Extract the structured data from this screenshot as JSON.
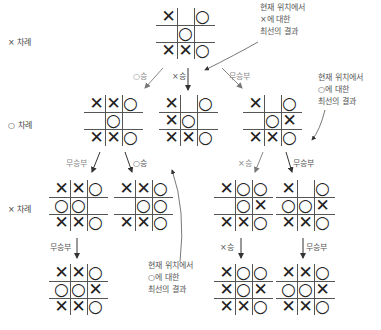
{
  "turn_labels": {
    "row0": "× 차례",
    "row1": "○ 차례",
    "row2": "× 차례"
  },
  "notes": {
    "top": [
      "현재 위치에서",
      "×에 대한",
      "최선의 결과"
    ],
    "right": [
      "현재 위치에서",
      "○에 대한",
      "최선의 결과"
    ],
    "bottom": [
      "현재 위치에서",
      "○에 대한",
      "최선의 결과"
    ]
  },
  "edge_labels": {
    "root_to_a": "○승",
    "root_to_b": "×승",
    "root_to_c": "무승부",
    "a_to_d": "무승부",
    "a_to_e": "○승",
    "c_to_f": "×승",
    "c_to_g": "무승부",
    "d_to_h": "무승부",
    "f_to_i": "×승",
    "g_to_j": "무승부"
  },
  "boards": {
    "root": [
      "X",
      "",
      "O",
      "",
      "O",
      "",
      "X",
      "X",
      "O"
    ],
    "a": [
      "X",
      "X",
      "O",
      "",
      "O",
      "",
      "X",
      "X",
      "O"
    ],
    "b": [
      "X",
      "",
      "O",
      "X",
      "O",
      "",
      "X",
      "X",
      "O"
    ],
    "c": [
      "X",
      "",
      "O",
      "",
      "O",
      "X",
      "X",
      "X",
      "O"
    ],
    "d": [
      "X",
      "X",
      "O",
      "O",
      "O",
      "",
      "X",
      "X",
      "O"
    ],
    "e": [
      "X",
      "X",
      "O",
      "",
      "O",
      "O",
      "X",
      "X",
      "O"
    ],
    "f": [
      "X",
      "O",
      "O",
      "",
      "O",
      "X",
      "X",
      "X",
      "O"
    ],
    "g": [
      "X",
      "",
      "O",
      "O",
      "O",
      "X",
      "X",
      "X",
      "O"
    ],
    "h": [
      "X",
      "X",
      "O",
      "O",
      "O",
      "X",
      "X",
      "X",
      "O"
    ],
    "i": [
      "X",
      "O",
      "O",
      "X",
      "O",
      "X",
      "X",
      "X",
      "O"
    ],
    "j": [
      "X",
      "X",
      "O",
      "O",
      "O",
      "X",
      "X",
      "X",
      "O"
    ]
  }
}
